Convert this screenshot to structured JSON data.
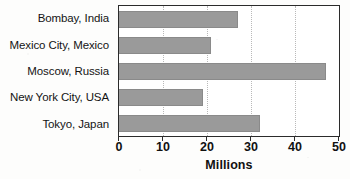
{
  "chart_data": {
    "type": "bar",
    "orientation": "horizontal",
    "title": "",
    "xlabel": "Millions",
    "ylabel": "",
    "categories": [
      "Bombay, India",
      "Mexico City, Mexico",
      "Moscow, Russia",
      "New York City, USA",
      "Tokyo, Japan"
    ],
    "values": [
      27,
      21,
      47,
      19,
      32
    ],
    "xlim": [
      0,
      50
    ],
    "xticks": [
      0,
      10,
      20,
      30,
      40,
      50
    ],
    "xtick_labels": [
      "0",
      "10",
      "20",
      "30",
      "40",
      "50"
    ],
    "grid": true,
    "grid_axis": "x",
    "legend": false,
    "bar_color": "#9a9a9a",
    "axis_color": "#2b2b2b",
    "grid_color": "#b9b9b9",
    "background_color": "#ffffff"
  }
}
